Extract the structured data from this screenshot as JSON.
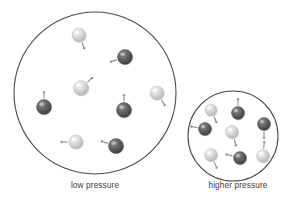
{
  "figure": {
    "title": "",
    "type": "particle-diagram",
    "background": "#ffffff",
    "container_stroke": "#4a4a4a",
    "light_particle_color": "#d8d8d8",
    "dark_particle_color": "#5a5a5a",
    "arrow_color": "#8a8a8a"
  },
  "captions": {
    "left": "low pressure",
    "right": "higher pressure"
  },
  "containers": [
    {
      "name": "low-pressure-container",
      "cx": 95,
      "cy": 93,
      "r": 81,
      "label": "low pressure",
      "particle_count": 8
    },
    {
      "name": "higher-pressure-container",
      "cx": 233,
      "cy": 136,
      "r": 45,
      "label": "higher pressure",
      "particle_count": 9
    }
  ],
  "particles_low": [
    {
      "id": "p1",
      "cx": 79,
      "cy": 35,
      "r": 7.0,
      "shade": "light",
      "arrow": {
        "dx": 4,
        "dy": 10,
        "dir": "down-right"
      }
    },
    {
      "id": "p2",
      "cx": 125,
      "cy": 57,
      "r": 7.5,
      "shade": "dark",
      "arrow": {
        "dx": -12,
        "dy": 4,
        "dir": "left"
      }
    },
    {
      "id": "p3",
      "cx": 81,
      "cy": 88,
      "r": 7.5,
      "shade": "light",
      "arrow": {
        "dx": 10,
        "dy": -9,
        "dir": "up-right"
      }
    },
    {
      "id": "p4",
      "cx": 157,
      "cy": 93,
      "r": 7.0,
      "shade": "light",
      "arrow": {
        "dx": 7,
        "dy": 11,
        "dir": "down-right"
      }
    },
    {
      "id": "p5",
      "cx": 44,
      "cy": 107,
      "r": 7.5,
      "shade": "dark",
      "arrow": {
        "dx": 0,
        "dy": -13,
        "dir": "up"
      }
    },
    {
      "id": "p6",
      "cx": 124,
      "cy": 110,
      "r": 7.5,
      "shade": "dark",
      "arrow": {
        "dx": 0,
        "dy": -13,
        "dir": "up"
      }
    },
    {
      "id": "p7",
      "cx": 76,
      "cy": 142,
      "r": 7.0,
      "shade": "light",
      "arrow": {
        "dx": -12,
        "dy": 0,
        "dir": "left"
      }
    },
    {
      "id": "p8",
      "cx": 116,
      "cy": 146,
      "r": 7.5,
      "shade": "dark",
      "arrow": {
        "dx": -12,
        "dy": -4,
        "dir": "up-left"
      }
    }
  ],
  "particles_high": [
    {
      "id": "q1",
      "cx": 211,
      "cy": 110,
      "r": 6.0,
      "shade": "light",
      "arrow": {
        "dx": 4,
        "dy": 9,
        "dir": "down-right"
      }
    },
    {
      "id": "q2",
      "cx": 238,
      "cy": 113,
      "r": 6.5,
      "shade": "dark",
      "arrow": {
        "dx": 0,
        "dy": -11,
        "dir": "up"
      }
    },
    {
      "id": "q3",
      "cx": 264,
      "cy": 124,
      "r": 6.5,
      "shade": "dark",
      "arrow": {
        "dx": 0,
        "dy": 11,
        "dir": "down"
      }
    },
    {
      "id": "q4",
      "cx": 205,
      "cy": 129,
      "r": 6.5,
      "shade": "dark",
      "arrow": {
        "dx": -11,
        "dy": -2,
        "dir": "left"
      }
    },
    {
      "id": "q5",
      "cx": 232,
      "cy": 132,
      "r": 6.5,
      "shade": "light",
      "arrow": {
        "dx": 3,
        "dy": 10,
        "dir": "down-right"
      }
    },
    {
      "id": "q6",
      "cx": 211,
      "cy": 155,
      "r": 6.5,
      "shade": "light",
      "arrow": {
        "dx": 4,
        "dy": 9,
        "dir": "down-right"
      }
    },
    {
      "id": "q7",
      "cx": 240,
      "cy": 158,
      "r": 6.5,
      "shade": "dark",
      "arrow": {
        "dx": -11,
        "dy": -3,
        "dir": "up-left"
      }
    },
    {
      "id": "q8",
      "cx": 263,
      "cy": 156,
      "r": 6.5,
      "shade": "light",
      "arrow": {
        "dx": 1,
        "dy": -11,
        "dir": "up"
      }
    },
    {
      "id": "q9",
      "cx": 249,
      "cy": 144,
      "r": 0.0,
      "shade": "none",
      "arrow": {
        "dx": 0,
        "dy": 0,
        "dir": "none"
      }
    }
  ]
}
